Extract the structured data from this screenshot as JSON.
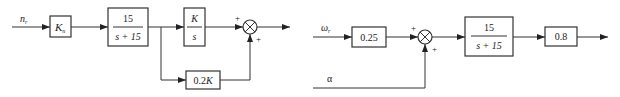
{
  "diagram_left": {
    "input_label": "n",
    "input_subscript": "r",
    "gain_block": {
      "symbol": "K",
      "subscript": "n"
    },
    "tf_block": {
      "numerator": "15",
      "denominator": "s + 15"
    },
    "integrator_block": {
      "numerator": "K",
      "denominator": "s"
    },
    "feedforward_block": {
      "label": "0.2",
      "symbol": "K"
    },
    "sum_signs": [
      "+",
      "+"
    ]
  },
  "diagram_right": {
    "input_label": "ω",
    "input_subscript": "r",
    "gain_block": {
      "label": "0.25"
    },
    "second_input_label": "α",
    "tf_block": {
      "numerator": "15",
      "denominator": "s + 15"
    },
    "output_gain_block": {
      "label": "0.8"
    },
    "sum_signs": [
      "+",
      "+"
    ]
  }
}
